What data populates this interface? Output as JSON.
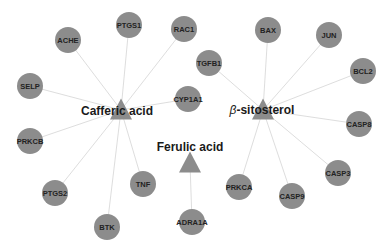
{
  "diagram": {
    "type": "compound-target network",
    "colors": {
      "node_fill": "#8c8c8c",
      "edge": "#d9d9d9",
      "label": "#222222",
      "background": "#ffffff"
    },
    "compounds": [
      {
        "id": "caffeic",
        "label": "Cafferic acid",
        "shape": "triangle",
        "x": 121,
        "y": 110,
        "label_x": 117,
        "label_y": 111
      },
      {
        "id": "sitosterol",
        "label": "β-sitosterol",
        "shape": "triangle",
        "x": 263,
        "y": 110,
        "label_x": 262,
        "label_y": 110
      },
      {
        "id": "ferulic",
        "label": "Ferulic acid",
        "shape": "triangle",
        "x": 190,
        "y": 163,
        "label_x": 190,
        "label_y": 147
      }
    ],
    "targets": [
      {
        "id": "PTGS1",
        "label": "PTGS1",
        "x": 129,
        "y": 25,
        "compound": "caffeic"
      },
      {
        "id": "RAC1",
        "label": "RAC1",
        "x": 184,
        "y": 29,
        "compound": "caffeic"
      },
      {
        "id": "ACHE",
        "label": "ACHE",
        "x": 68,
        "y": 40,
        "compound": "caffeic"
      },
      {
        "id": "SELP",
        "label": "SELP",
        "x": 30,
        "y": 86,
        "compound": "caffeic"
      },
      {
        "id": "CYP1A1",
        "label": "CYP1A1",
        "x": 188,
        "y": 99,
        "compound": "caffeic"
      },
      {
        "id": "PRKCB",
        "label": "PRKCB",
        "x": 30,
        "y": 141,
        "compound": "caffeic"
      },
      {
        "id": "PTGS2",
        "label": "PTGS2",
        "x": 55,
        "y": 193,
        "compound": "caffeic"
      },
      {
        "id": "TNF",
        "label": "TNF",
        "x": 143,
        "y": 184,
        "compound": "caffeic"
      },
      {
        "id": "BTK",
        "label": "BTK",
        "x": 107,
        "y": 227,
        "compound": "caffeic"
      },
      {
        "id": "TGFB1",
        "label": "TGFB1",
        "x": 209,
        "y": 63,
        "compound": "sitosterol"
      },
      {
        "id": "BAX",
        "label": "BAX",
        "x": 268,
        "y": 30,
        "compound": "sitosterol"
      },
      {
        "id": "JUN",
        "label": "JUN",
        "x": 329,
        "y": 35,
        "compound": "sitosterol"
      },
      {
        "id": "BCL2",
        "label": "BCL2",
        "x": 363,
        "y": 71,
        "compound": "sitosterol"
      },
      {
        "id": "CASP8",
        "label": "CASP8",
        "x": 359,
        "y": 124,
        "compound": "sitosterol"
      },
      {
        "id": "CASP3",
        "label": "CASP3",
        "x": 338,
        "y": 173,
        "compound": "sitosterol"
      },
      {
        "id": "CASP9",
        "label": "CASP9",
        "x": 292,
        "y": 196,
        "compound": "sitosterol"
      },
      {
        "id": "PRKCA",
        "label": "PRKCA",
        "x": 239,
        "y": 187,
        "compound": "sitosterol"
      },
      {
        "id": "ADRA1A",
        "label": "ADRA1A",
        "x": 192,
        "y": 222,
        "compound": "ferulic"
      }
    ]
  }
}
